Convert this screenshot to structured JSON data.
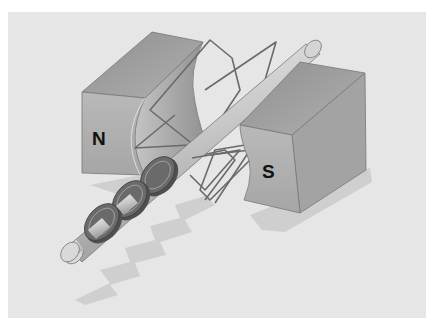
{
  "diagram": {
    "labels": {
      "north_pole": "N",
      "south_pole": "S"
    },
    "components": [
      "north-pole-magnet",
      "south-pole-magnet",
      "wire-coil",
      "shaft",
      "slip-rings"
    ],
    "slip_ring_count": 3,
    "colors": {
      "panel_background": "#e6e6e6",
      "page_background": "#ffffff",
      "magnet_front": "#b4b4b4",
      "magnet_top": "#9e9e9e",
      "magnet_side": "#a8a8a8",
      "shaft": "#c8c8c8",
      "ring": "#5f5f5f",
      "wire": "#6a6a6a",
      "shadow": "#cfcfcf"
    }
  }
}
